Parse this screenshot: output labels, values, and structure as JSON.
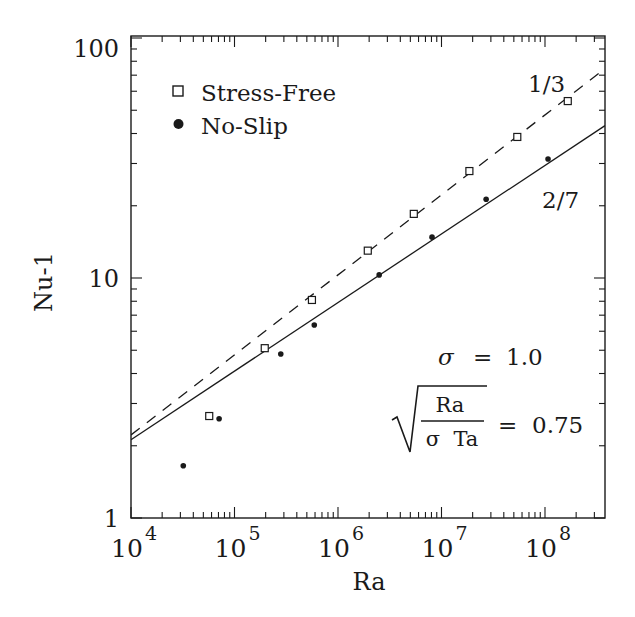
{
  "chart_data": {
    "type": "scatter",
    "title": "",
    "xlabel": "Ra",
    "ylabel": "Nu-1",
    "xscale": "log",
    "yscale": "log",
    "xlim": [
      10000,
      380000000
    ],
    "ylim": [
      1,
      100
    ],
    "grid": false,
    "x_tick_labels": [
      {
        "base": "10",
        "exp": "4",
        "value": 10000
      },
      {
        "base": "10",
        "exp": "5",
        "value": 100000
      },
      {
        "base": "10",
        "exp": "6",
        "value": 1000000
      },
      {
        "base": "10",
        "exp": "7",
        "value": 10000000
      },
      {
        "base": "10",
        "exp": "8",
        "value": 100000000
      }
    ],
    "y_tick_labels": [
      {
        "label": "1",
        "value": 1
      },
      {
        "label": "10",
        "value": 10
      },
      {
        "label": "100",
        "value": 100
      }
    ],
    "legend_position": "upper-left",
    "legend": [
      {
        "label": "Stress-Free",
        "marker": "open-square"
      },
      {
        "label": "No-Slip",
        "marker": "filled-circle"
      }
    ],
    "series": [
      {
        "name": "Stress-Free",
        "marker": "open-square",
        "x": [
          57000,
          196000,
          560000,
          1940000,
          5400000,
          18600000,
          54000000,
          166000000
        ],
        "y": [
          2.66,
          5.1,
          8.1,
          13.0,
          18.5,
          27.9,
          38.7,
          54.6
        ]
      },
      {
        "name": "No-Slip",
        "marker": "filled-circle",
        "x": [
          32000,
          71000,
          280000,
          590000,
          2500000,
          8100000,
          27000000,
          107000000
        ],
        "y": [
          1.65,
          2.59,
          4.82,
          6.37,
          10.3,
          14.8,
          21.3,
          31.3
        ]
      }
    ],
    "fit_lines": [
      {
        "name": "1/3 fit",
        "style": "dashed",
        "exponent": 0.3333,
        "y_at_1e4": 2.22,
        "label": "1/3"
      },
      {
        "name": "2/7 fit",
        "style": "solid",
        "exponent": 0.2857,
        "y_at_1e4": 2.12,
        "label": "2/7"
      }
    ],
    "annotations": {
      "sigma": {
        "symbol": "σ",
        "equals": "=",
        "value": "1.0"
      },
      "ratio": {
        "numerator": "Ra",
        "denominator": "σ  Ta",
        "equals": "=",
        "value": "0.75"
      },
      "slope_one_third": "1/3",
      "slope_two_sevenths": "2/7"
    }
  }
}
